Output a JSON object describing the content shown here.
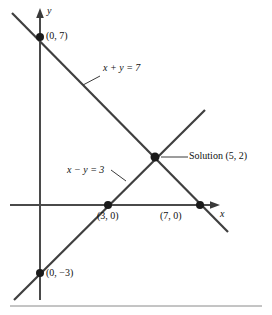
{
  "figure": {
    "type": "coordinate-graph",
    "background_color": "#ffffff",
    "line_color": "#3a3a3a",
    "text_color": "#111111",
    "axes": {
      "x_label": "x",
      "y_label": "y",
      "origin_px": {
        "x": 40,
        "y": 205
      },
      "units_per_px": 22.8
    },
    "lines": [
      {
        "name": "line-x-plus-y",
        "equation_label": "x + y = 7",
        "equation_parts": {
          "lhs_var1": "x",
          "operator": "+",
          "lhs_var2": "y",
          "equals": "=",
          "rhs": "7"
        },
        "slope": -1,
        "intercept": 7,
        "label_position_px": {
          "x": 104,
          "y": 64
        },
        "leader_from_px": {
          "x": 100,
          "y": 76
        },
        "leader_to_px": {
          "x": 83,
          "y": 84
        },
        "start_px": {
          "x": 12,
          "y": 13
        },
        "end_px": {
          "x": 228,
          "y": 232
        }
      },
      {
        "name": "line-x-minus-y",
        "equation_label": "x − y = 3",
        "equation_parts": {
          "lhs_var1": "x",
          "operator": "−",
          "lhs_var2": "y",
          "equals": "=",
          "rhs": "3"
        },
        "slope": 1,
        "intercept": -3,
        "label_position_px": {
          "x": 68,
          "y": 166
        },
        "leader_from_px": {
          "x": 112,
          "y": 172
        },
        "leader_to_px": {
          "x": 128,
          "y": 182
        },
        "start_px": {
          "x": 14,
          "y": 300
        },
        "end_px": {
          "x": 205,
          "y": 110
        }
      }
    ],
    "points": [
      {
        "name": "point-0-7",
        "label": "(0, 7)",
        "coords": [
          0,
          7
        ],
        "dot_px": {
          "x": 40,
          "y": 37
        },
        "label_px": {
          "x": 46,
          "y": 32
        }
      },
      {
        "name": "point-3-0",
        "label": "(3, 0)",
        "coords": [
          3,
          0
        ],
        "dot_px": {
          "x": 108,
          "y": 205
        },
        "label_px": {
          "x": 99,
          "y": 211
        }
      },
      {
        "name": "point-7-0",
        "label": "(7, 0)",
        "coords": [
          7,
          0
        ],
        "dot_px": {
          "x": 200,
          "y": 205
        },
        "label_px": {
          "x": 162,
          "y": 211
        }
      },
      {
        "name": "point-0-minus-3",
        "label": "(0, −3)",
        "coords": [
          0,
          -3
        ],
        "dot_px": {
          "x": 40,
          "y": 273
        },
        "label_px": {
          "x": 46,
          "y": 268
        }
      },
      {
        "name": "point-solution",
        "label": "Solution (5, 2)",
        "label_word": "Solution",
        "label_coords": "(5, 2)",
        "coords": [
          5,
          2
        ],
        "dot_px": {
          "x": 155,
          "y": 157
        },
        "label_px": {
          "x": 190,
          "y": 151
        },
        "leader_from_px": {
          "x": 163,
          "y": 157
        },
        "leader_to_px": {
          "x": 187,
          "y": 157
        }
      }
    ],
    "axis_labels": {
      "x": {
        "text": "x",
        "px": {
          "x": 221,
          "y": 210
        }
      },
      "y": {
        "text": "y",
        "px": {
          "x": 47,
          "y": 11
        }
      }
    },
    "bottom_rule": {
      "y_px": 306,
      "x_start_px": 10,
      "x_end_px": 262
    }
  }
}
